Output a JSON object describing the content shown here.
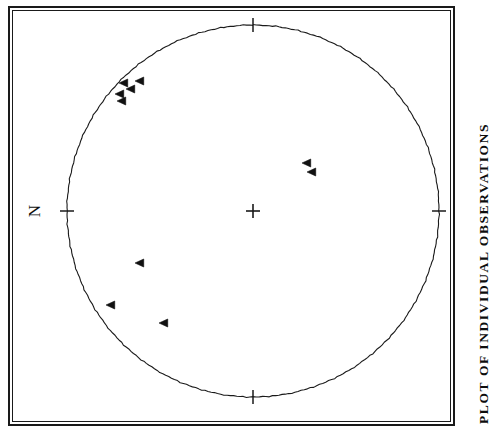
{
  "figure": {
    "caption": "PLOT OF INDIVIDUAL OBSERVATIONS",
    "north_label": "N",
    "caption_rotation_deg": -90,
    "north_label_rotation_deg": -90
  },
  "colors": {
    "ink": "#1a1a1a",
    "background": "#ffffff",
    "marker": "#111111"
  },
  "chart_data": {
    "type": "scatter",
    "projection": "equal-area-stereonet",
    "title": "PLOT OF INDIVIDUAL OBSERVATIONS",
    "xlabel": "",
    "ylabel": "",
    "grid": false,
    "legend": null,
    "net": {
      "center_px": [
        240,
        200
      ],
      "radius_px": 186,
      "primitive_circle": true,
      "center_marker": "plus",
      "tick_azimuths_deg": [
        0,
        90,
        180,
        270
      ],
      "tick_labels": [
        "N",
        "",
        "",
        ""
      ],
      "tick_length_px": 14
    },
    "marker_style": {
      "shape": "left-pointing-triangle",
      "filled": true,
      "size_px": 8
    },
    "n_points": 10,
    "points_px": [
      [
        111,
        72
      ],
      [
        127,
        70
      ],
      [
        118,
        78
      ],
      [
        107,
        83
      ],
      [
        109,
        90
      ],
      [
        294,
        152
      ],
      [
        299,
        161
      ],
      [
        127,
        252
      ],
      [
        98,
        294
      ],
      [
        151,
        312
      ]
    ],
    "points_polar": [
      {
        "azimuth_deg": 310,
        "plunge_deg": 16,
        "label": ""
      },
      {
        "azimuth_deg": 317,
        "plunge_deg": 14,
        "label": ""
      },
      {
        "azimuth_deg": 312,
        "plunge_deg": 19,
        "label": ""
      },
      {
        "azimuth_deg": 307,
        "plunge_deg": 20,
        "label": ""
      },
      {
        "azimuth_deg": 306,
        "plunge_deg": 23,
        "label": ""
      },
      {
        "azimuth_deg": 74,
        "plunge_deg": 61,
        "label": ""
      },
      {
        "azimuth_deg": 72,
        "plunge_deg": 58,
        "label": ""
      },
      {
        "azimuth_deg": 246,
        "plunge_deg": 50,
        "label": ""
      },
      {
        "azimuth_deg": 233,
        "plunge_deg": 28,
        "label": ""
      },
      {
        "azimuth_deg": 220,
        "plunge_deg": 25,
        "label": ""
      }
    ]
  }
}
